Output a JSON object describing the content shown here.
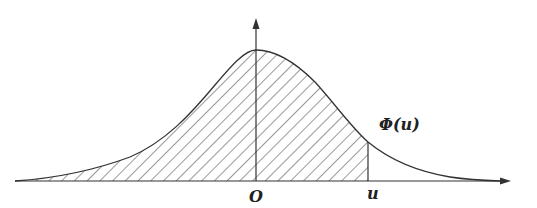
{
  "diagram": {
    "type": "normal-distribution-cdf",
    "labels": {
      "origin": "O",
      "u": "u",
      "area": "Φ(u)"
    },
    "colors": {
      "stroke": "#333333",
      "background": "#ffffff"
    },
    "shaded_region": "from -∞ to u (hatched)"
  }
}
